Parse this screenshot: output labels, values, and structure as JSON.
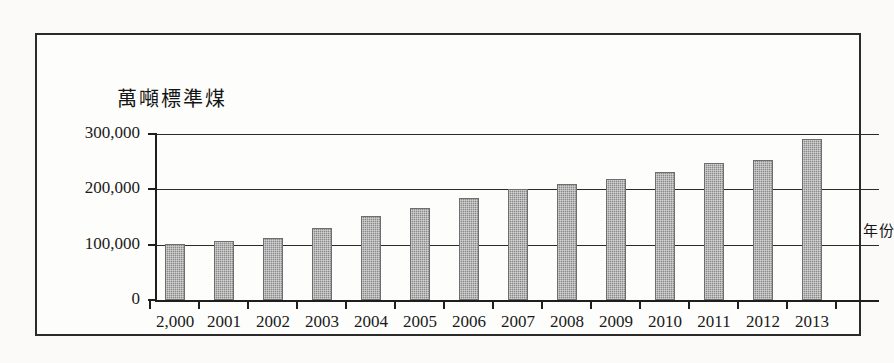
{
  "chart_data": {
    "type": "bar",
    "title": "",
    "unit_label": "萬噸標準煤",
    "xlabel": "年份",
    "ylabel": "",
    "categories": [
      "2,000",
      "2001",
      "2002",
      "2003",
      "2004",
      "2005",
      "2006",
      "2007",
      "2008",
      "2009",
      "2010",
      "2011",
      "2012",
      "2013"
    ],
    "values": [
      102000,
      106000,
      112000,
      130000,
      151000,
      167000,
      184000,
      200000,
      209000,
      219000,
      232000,
      248000,
      253000,
      291000
    ],
    "ylim": [
      0,
      300000
    ],
    "ytick_labels": [
      "0",
      "100,000",
      "200,000",
      "300,000"
    ],
    "ytick_values": [
      0,
      100000,
      200000,
      300000
    ],
    "grid": true,
    "legend": false,
    "bar_color": "#8a8a8a",
    "axis_color": "#1e1e1e"
  }
}
